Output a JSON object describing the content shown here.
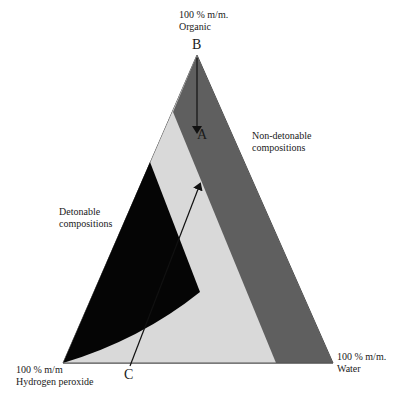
{
  "diagram": {
    "type": "ternary",
    "vertices": {
      "top": {
        "line1": "100 % m/m.",
        "line2": "Organic"
      },
      "bottom_left": {
        "line1": "100 % m/m",
        "line2": "Hydrogen peroxide"
      },
      "bottom_right": {
        "line1": "100 % m/m.",
        "line2": "Water"
      }
    },
    "regions": {
      "non_detonable": {
        "line1": "Non-detonable",
        "line2": "compositions",
        "color": "#5f5f5f"
      },
      "detonable": {
        "line1": "Detonable",
        "line2": "compositions",
        "color": "#050505"
      },
      "intermediate": {
        "color": "#d9d9d9"
      }
    },
    "points": {
      "A": "A",
      "B": "B",
      "C": "C"
    },
    "arrows": [
      {
        "from": "B",
        "to": "A"
      },
      {
        "from": "C",
        "to": "A"
      }
    ]
  }
}
